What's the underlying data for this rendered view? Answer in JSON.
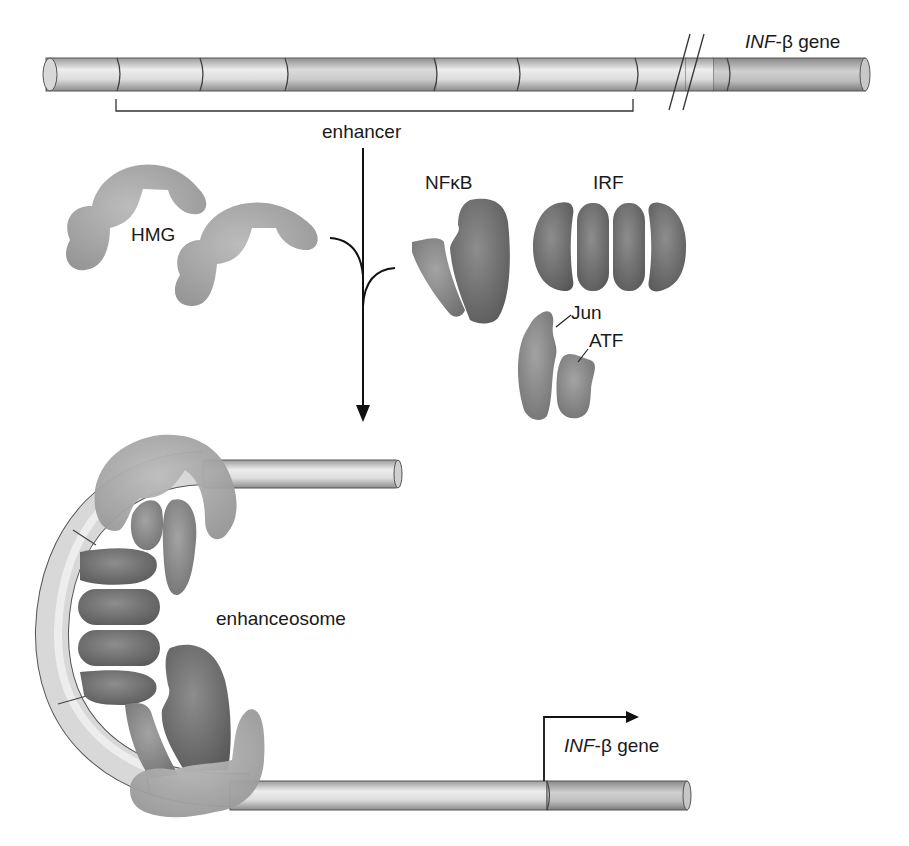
{
  "diagram": {
    "top_dna": {
      "gene_label_italic": "INF",
      "gene_label_rest": "-β gene",
      "bracket_label": "enhancer"
    },
    "proteins": {
      "hmg": "HMG",
      "nfkb": "NFκB",
      "irf": "IRF",
      "jun": "Jun",
      "atf": "ATF"
    },
    "complex_label": "enhanceosome",
    "bottom_dna": {
      "gene_label_italic": "INF",
      "gene_label_rest": "-β gene"
    },
    "colors": {
      "dna_light": "#e6e6e6",
      "dna_mid": "#bdbdbd",
      "dna_outline": "#555555",
      "hmg_fill": "#a8a8a8",
      "factor_fill": "#6e6e6e",
      "arrow": "#111111"
    }
  }
}
